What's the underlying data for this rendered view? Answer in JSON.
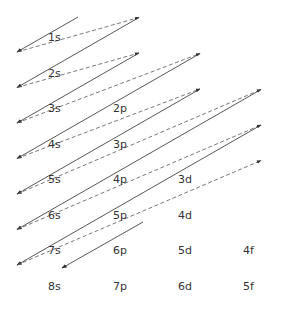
{
  "diagram": {
    "title": "",
    "type": "aufbau-filling-order",
    "colors": {
      "line": "#444444",
      "dash": "#555555",
      "text": "#333333"
    },
    "orbitals": [
      {
        "label": "1s",
        "n": 1,
        "l": "s"
      },
      {
        "label": "2s",
        "n": 2,
        "l": "s"
      },
      {
        "label": "2p",
        "n": 2,
        "l": "p"
      },
      {
        "label": "3s",
        "n": 3,
        "l": "s"
      },
      {
        "label": "3p",
        "n": 3,
        "l": "p"
      },
      {
        "label": "3d",
        "n": 3,
        "l": "d"
      },
      {
        "label": "4s",
        "n": 4,
        "l": "s"
      },
      {
        "label": "4p",
        "n": 4,
        "l": "p"
      },
      {
        "label": "4d",
        "n": 4,
        "l": "d"
      },
      {
        "label": "4f",
        "n": 4,
        "l": "f"
      },
      {
        "label": "5s",
        "n": 5,
        "l": "s"
      },
      {
        "label": "5p",
        "n": 5,
        "l": "p"
      },
      {
        "label": "5d",
        "n": 5,
        "l": "d"
      },
      {
        "label": "5f",
        "n": 5,
        "l": "f"
      },
      {
        "label": "6s",
        "n": 6,
        "l": "s"
      },
      {
        "label": "6p",
        "n": 6,
        "l": "p"
      },
      {
        "label": "6d",
        "n": 6,
        "l": "d"
      },
      {
        "label": "7s",
        "n": 7,
        "l": "s"
      },
      {
        "label": "7p",
        "n": 7,
        "l": "p"
      },
      {
        "label": "8s",
        "n": 8,
        "l": "s"
      }
    ],
    "filling_order": [
      "1s",
      "2s",
      "2p",
      "3s",
      "3p",
      "4s",
      "3d",
      "4p",
      "5s",
      "4d",
      "5p",
      "6s",
      "4f",
      "5d",
      "6p",
      "7s",
      "5f",
      "6d",
      "7p",
      "8s"
    ]
  }
}
